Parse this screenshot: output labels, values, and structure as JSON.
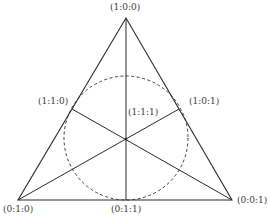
{
  "diagram": {
    "type": "triangle-with-medians-and-incircle",
    "labels": {
      "apex": "(1:0:0)",
      "bottom_left": "(0:1:0)",
      "bottom_right": "(0:0:1)",
      "left_mid": "(1:1:0)",
      "right_mid": "(1:0:1)",
      "bottom_mid": "(0:1:1)",
      "centroid": "(1:1:1)"
    },
    "colors": {
      "line": "#2a2a2a",
      "text": "#3a3a3a",
      "background": "#ffffff"
    }
  }
}
